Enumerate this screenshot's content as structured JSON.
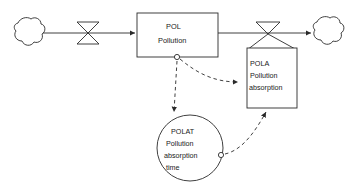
{
  "diagram": {
    "type": "system-dynamics-stock-flow",
    "title": "",
    "nodes": [
      {
        "id": "source-cloud",
        "kind": "cloud",
        "name": "source-cloud",
        "label": "",
        "cx": 28,
        "cy": 33,
        "r": 15
      },
      {
        "id": "inflow-valve",
        "kind": "flow-valve",
        "name": "inflow-valve",
        "label": "",
        "cx": 88,
        "cy": 33,
        "w": 22,
        "h": 22
      },
      {
        "id": "POL",
        "kind": "stock-box",
        "name": "pollution-stock",
        "label_code": "POL",
        "label_text": "Pollution",
        "x": 137,
        "y": 13,
        "w": 81,
        "h": 44
      },
      {
        "id": "outflow-valve",
        "kind": "flow-valve",
        "name": "outflow-valve",
        "label": "",
        "cx": 268,
        "cy": 33,
        "w": 24,
        "h": 22
      },
      {
        "id": "POLA",
        "kind": "rate-box",
        "name": "pollution-absorption-rate",
        "label_code": "POLA",
        "label_line1": "Pollution",
        "label_line2": "absorption",
        "x": 247,
        "y": 48,
        "w": 50,
        "h": 60
      },
      {
        "id": "sink-cloud",
        "kind": "cloud",
        "name": "sink-cloud",
        "label": "",
        "cx": 327,
        "cy": 32,
        "r": 15
      },
      {
        "id": "POLAT",
        "kind": "constant-circle",
        "name": "pollution-absorption-time-constant",
        "label_code": "POLAT",
        "label_line1": "Pollution",
        "label_line2": "absorption",
        "label_line3": "time",
        "cx": 190,
        "cy": 148,
        "r": 33
      }
    ],
    "connectors": [
      {
        "id": "c1",
        "name": "source-to-inflow-flow",
        "kind": "solid-flow",
        "from": "source-cloud",
        "to": "inflow-valve"
      },
      {
        "id": "c2",
        "name": "inflow-to-pol-flow",
        "kind": "solid-flow-arrow",
        "from": "inflow-valve",
        "to": "POL"
      },
      {
        "id": "c3",
        "name": "pol-to-outflow-flow",
        "kind": "solid-flow",
        "from": "POL",
        "to": "outflow-valve"
      },
      {
        "id": "c4",
        "name": "outflow-to-sink-flow",
        "kind": "solid-flow-arrow",
        "from": "outflow-valve",
        "to": "sink-cloud"
      },
      {
        "id": "c5",
        "name": "pol-to-polat-info-link",
        "kind": "dashed-info",
        "from": "POL",
        "to": "POLAT"
      },
      {
        "id": "c6",
        "name": "pol-to-pola-info-link",
        "kind": "dashed-info-arrow",
        "from": "POL",
        "to": "POLA"
      },
      {
        "id": "c7",
        "name": "polat-to-pola-info-link",
        "kind": "dashed-info-arrow",
        "from": "POLAT",
        "to": "POLA"
      }
    ],
    "colors": {
      "stroke": "#2a2a2a",
      "text": "#1a1a1a",
      "background": "#ffffff"
    }
  }
}
